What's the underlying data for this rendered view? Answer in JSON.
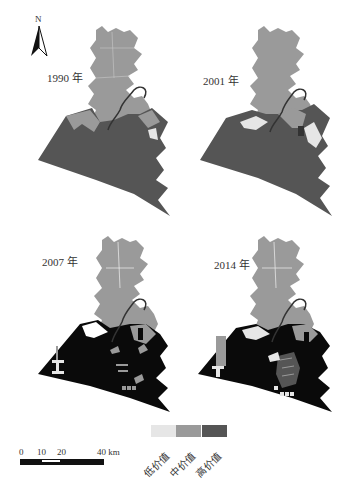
{
  "figure": {
    "north_arrow": {
      "label": "N",
      "icon": "north-arrow-icon"
    },
    "panels": [
      {
        "id": "1990",
        "label": "1990 年"
      },
      {
        "id": "2001",
        "label": "2001 年"
      },
      {
        "id": "2007",
        "label": "2007 年"
      },
      {
        "id": "2014",
        "label": "2014 年"
      }
    ],
    "legend": {
      "items": [
        {
          "label": "低价值",
          "color": "#e6e6e6"
        },
        {
          "label": "中价值",
          "color": "#9a9a9a"
        },
        {
          "label": "高价值",
          "color": "#555555"
        }
      ]
    },
    "scale_bar": {
      "ticks": [
        "0",
        "10",
        "20",
        "40 km"
      ]
    }
  },
  "colors": {
    "low": "#e6e6e6",
    "medium": "#9a9a9a",
    "high": "#555555",
    "very_high": "#0a0a0a",
    "background": "#ffffff"
  }
}
